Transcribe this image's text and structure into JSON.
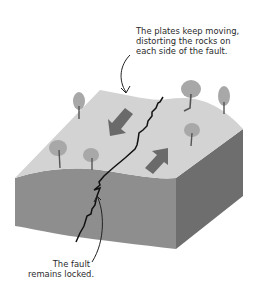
{
  "diagram": {
    "annotations": [
      {
        "id": "plates-moving",
        "lines": [
          "The plates keep moving,",
          "distorting the rocks on",
          "each side of the fault."
        ]
      },
      {
        "id": "fault-locked",
        "lines": [
          "The fault",
          "remains locked."
        ]
      }
    ],
    "elements": {
      "block": "Crustal block cut by a fault",
      "arrows": [
        "Left plate moving toward viewer-left",
        "Right plate moving away"
      ],
      "trees": 7
    },
    "colors": {
      "top_surface": "#d3d3d3",
      "front_face": "#8e8e8e",
      "right_face": "#6e6e6e",
      "arrow": "#6a6a6a",
      "tree_canopy": "#a8a8a8",
      "tree_trunk": "#555555",
      "fault_line": "#111111",
      "text": "#2a2a2a"
    }
  }
}
